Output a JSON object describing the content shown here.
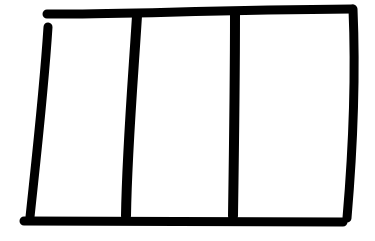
{
  "sketch": {
    "type": "wireframe",
    "description": "Hand-drawn three-column layout",
    "columns": 3,
    "stroke_color": "#000000",
    "background_color": "#ffffff",
    "stroke_width": 9
  }
}
